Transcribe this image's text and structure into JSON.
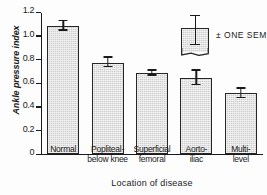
{
  "chart_data": {
    "type": "bar",
    "title": "",
    "xlabel": "Location of disease",
    "ylabel": "Ankle pressure index",
    "categories": [
      "Normal",
      "Popliteal-below knee",
      "Superficial femoral",
      "Aorto-iliac",
      "Multi-level"
    ],
    "category_lines": [
      [
        "Normal"
      ],
      [
        "Popliteal-",
        "below knee"
      ],
      [
        "Superficial",
        "femoral"
      ],
      [
        "Aorto-",
        "iliac"
      ],
      [
        "Multi-",
        "level"
      ]
    ],
    "values": [
      1.08,
      0.77,
      0.68,
      0.64,
      0.51
    ],
    "errors": [
      0.04,
      0.04,
      0.02,
      0.06,
      0.04
    ],
    "error_type": "± one SEM",
    "ylim": [
      0,
      1.2
    ],
    "yticks": [
      0,
      0.2,
      0.4,
      0.6,
      0.8,
      1.0,
      1.2
    ],
    "ytick_labels": [
      "0",
      "0.2",
      "0.4",
      "0.6",
      "0.8",
      "1.0",
      "1.2"
    ],
    "grid": false,
    "legend": {
      "position": "top-right",
      "label": "± ONE SEM",
      "swatch": "shaded-bar-with-error-bar"
    },
    "colors": {
      "bar_fill": "#cfcfcf",
      "bar_border": "#262626",
      "axis": "#1a1a1a",
      "text": "#1a1a1a",
      "background": "#fdfdfd"
    }
  }
}
